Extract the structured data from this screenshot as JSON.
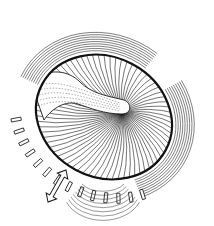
{
  "figure": {
    "type": "line-art-illustration",
    "width": 214,
    "height": 226,
    "background": "#ffffff",
    "ink": "#1a1a1a",
    "elements": {
      "ellipse": {
        "cx": 104,
        "cy": 117,
        "rx": 70,
        "ry": 60,
        "rotate": 28,
        "stroke_width": 2.2
      },
      "focus_point": {
        "x": 122,
        "y": 112
      },
      "radial_hatch_count": 72,
      "tube": {
        "label": "club-shaped-tube"
      },
      "outer_arcs_upper_left": 9,
      "outer_arcs_right": 9,
      "dashed_arc_segments": 14,
      "double_arrow": {
        "x1": 48,
        "y1": 202,
        "x2": 66,
        "y2": 170
      }
    }
  }
}
